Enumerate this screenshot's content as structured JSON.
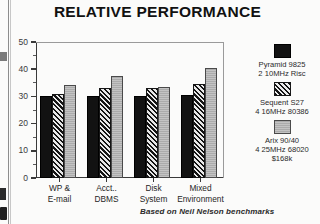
{
  "chart_data": {
    "type": "bar",
    "title": "RELATIVE PERFORMANCE",
    "xlabel": "",
    "ylabel": "",
    "ylim": [
      0,
      50
    ],
    "yticks": [
      0,
      10,
      20,
      30,
      40,
      50
    ],
    "yminor_step": 5,
    "grid": false,
    "legend_position": "right",
    "source_note": "Based on Neil Nelson benchmarks",
    "categories": [
      {
        "line1": "WP &",
        "line2": "E-mail"
      },
      {
        "line1": "Acct..",
        "line2": "DBMS"
      },
      {
        "line1": "Disk",
        "line2": "System"
      },
      {
        "line1": "Mixed",
        "line2": "Environment"
      }
    ],
    "series": [
      {
        "name": "Pyramid 9825",
        "legend_lines": [
          "Pyramid 9825",
          "2 10MHz Risc"
        ],
        "swatch": "solid-black",
        "values": [
          30.0,
          30.1,
          30.2,
          30.4
        ]
      },
      {
        "name": "Sequent S27",
        "legend_lines": [
          "Sequent S27",
          "4 16MHz 80386"
        ],
        "swatch": "diagonal-hatch",
        "values": [
          31.0,
          33.2,
          33.0,
          34.5
        ]
      },
      {
        "name": "Arix 90/40",
        "legend_lines": [
          "Arix 90/40",
          "4 25MHz 68020",
          "$168k"
        ],
        "swatch": "light-gray",
        "values": [
          34.2,
          37.5,
          33.5,
          40.5
        ]
      }
    ]
  },
  "colors": {
    "series_0": "#121212",
    "series_1": "#d8d8d8",
    "series_2": "#b9b9b9",
    "axis": "#3a3a3a",
    "text": "#1a1a1a",
    "background": "#fbfbfa"
  }
}
